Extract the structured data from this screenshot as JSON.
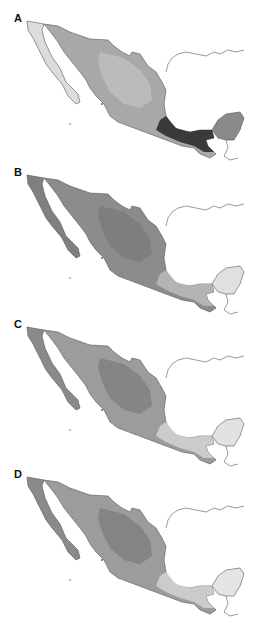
{
  "figure": {
    "panels": [
      {
        "label": "A",
        "top": 12,
        "mainland_fill": "#a8a8a8",
        "baja_fill": "#dcdcdc",
        "south_fill": "#2e2e2e",
        "yucatan_fill": "#8a8a8a",
        "core_fill": "#c2c2c2"
      },
      {
        "label": "B",
        "top": 166,
        "mainland_fill": "#8c8c8c",
        "baja_fill": "#808080",
        "south_fill": "#b8b8b8",
        "yucatan_fill": "#e0e0e0",
        "core_fill": "#7a7a7a"
      },
      {
        "label": "C",
        "top": 318,
        "mainland_fill": "#9c9c9c",
        "baja_fill": "#8a8a8a",
        "south_fill": "#d0d0d0",
        "yucatan_fill": "#e2e2e2",
        "core_fill": "#7e7e7e"
      },
      {
        "label": "D",
        "top": 468,
        "mainland_fill": "#9c9c9c",
        "baja_fill": "#8a8a8a",
        "south_fill": "#d0d0d0",
        "yucatan_fill": "#e4e4e4",
        "core_fill": "#7c7c7c"
      }
    ]
  }
}
